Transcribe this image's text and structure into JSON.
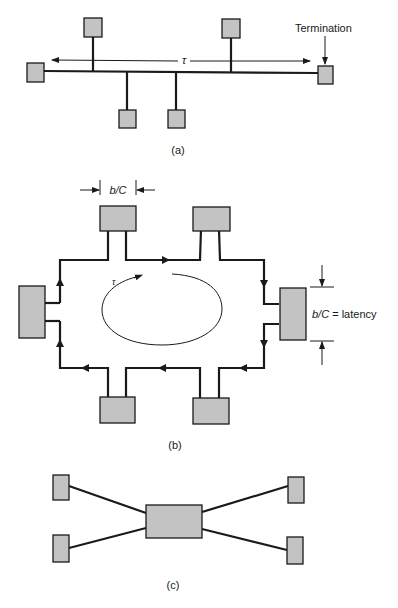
{
  "diagram_a": {
    "caption": "(a)",
    "termination_label": "Termination",
    "tau_label": "τ",
    "topology": "bus"
  },
  "diagram_b": {
    "caption": "(b)",
    "bc_top_label": "b/C",
    "latency_label": "b/C = latency",
    "tau_label": "τ",
    "topology": "ring"
  },
  "diagram_c": {
    "caption": "(c)",
    "topology": "star"
  },
  "colors": {
    "box_fill": "#c3c3c3",
    "line": "#1a1a1a"
  }
}
